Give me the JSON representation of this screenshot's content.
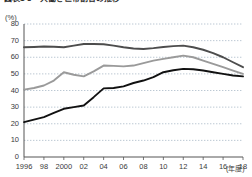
{
  "figure": {
    "title": "図表1-3　共働き世帯割合の推移",
    "unit_label": "(%)",
    "xaxis_unit": "(年度)"
  },
  "chart_data": {
    "type": "line",
    "title": "図表1-3　共働き世帯割合の推移",
    "xlabel": "(年度)",
    "ylabel": "(%)",
    "ylim": [
      0,
      80
    ],
    "ytick_step": 10,
    "yticks": [
      0,
      10,
      20,
      30,
      40,
      50,
      60,
      70,
      80
    ],
    "xlim": [
      1996,
      2018
    ],
    "xticks": [
      1996,
      1998,
      2000,
      2002,
      2004,
      2006,
      2008,
      2010,
      2012,
      2014,
      2016,
      2018
    ],
    "xtick_labels": [
      "1996",
      "98",
      "2000",
      "02",
      "04",
      "06",
      "08",
      "10",
      "12",
      "14",
      "16",
      "18"
    ],
    "grid": "horizontal-dotted",
    "legend": "none",
    "x": [
      1996,
      1997,
      1998,
      1999,
      2000,
      2001,
      2002,
      2003,
      2004,
      2005,
      2006,
      2007,
      2008,
      2009,
      2010,
      2011,
      2012,
      2013,
      2014,
      2015,
      2016,
      2017,
      2018
    ],
    "series": [
      {
        "name": "series-upper",
        "color": "#4d4d4d",
        "values": [
          66.0,
          66.2,
          66.5,
          66.3,
          66.0,
          67.0,
          68.0,
          68.0,
          67.8,
          67.0,
          66.0,
          65.3,
          65.0,
          65.5,
          66.2,
          66.7,
          67.0,
          66.0,
          64.5,
          62.5,
          60.0,
          57.0,
          54.0
        ]
      },
      {
        "name": "series-middle",
        "color": "#9a9a9a",
        "values": [
          40.5,
          41.5,
          43.0,
          46.0,
          51.0,
          49.5,
          48.5,
          51.5,
          55.0,
          54.8,
          54.5,
          55.0,
          56.5,
          58.0,
          59.0,
          60.0,
          61.0,
          60.0,
          58.0,
          56.0,
          54.0,
          52.0,
          50.0
        ]
      },
      {
        "name": "series-lower",
        "color": "#111111",
        "values": [
          21.0,
          22.5,
          24.0,
          26.5,
          29.0,
          30.0,
          31.0,
          36.0,
          41.3,
          41.5,
          42.5,
          44.5,
          46.0,
          48.0,
          51.0,
          52.2,
          53.0,
          52.8,
          52.0,
          51.0,
          50.0,
          49.0,
          48.5
        ]
      }
    ]
  }
}
